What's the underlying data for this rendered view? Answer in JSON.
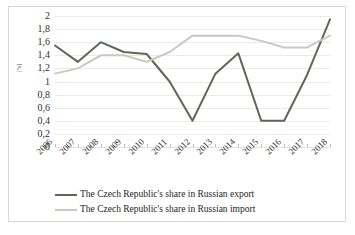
{
  "chart_data": {
    "type": "line",
    "title": "",
    "subtitle": "",
    "xlabel": "",
    "ylabel": "[%]",
    "categories": [
      "2006",
      "2007",
      "2008",
      "2009",
      "2010",
      "2011",
      "2012",
      "2013",
      "2014",
      "2015",
      "2016",
      "2017",
      "2018"
    ],
    "ylim": [
      0,
      2
    ],
    "ytick_labels": [
      "2",
      "1,8",
      "1,6",
      "1,4",
      "1,2",
      "1",
      "0,8",
      "0,6",
      "0,4",
      "0,2",
      "0"
    ],
    "ytick_values": [
      2,
      1.8,
      1.6,
      1.4,
      1.2,
      1,
      0.8,
      0.6,
      0.4,
      0.2,
      0
    ],
    "grid": true,
    "legend_position": "bottom",
    "series": [
      {
        "name": "The Czech Republic's share in Russian export",
        "color": "#5f665c",
        "values": [
          1.55,
          1.3,
          1.6,
          1.45,
          1.42,
          1.0,
          0.4,
          1.12,
          1.43,
          0.4,
          0.4,
          1.1,
          1.95
        ]
      },
      {
        "name": "The Czech Republic's share in Russian import",
        "color": "#c8cabf",
        "values": [
          1.12,
          1.2,
          1.4,
          1.4,
          1.3,
          1.45,
          1.7,
          1.7,
          1.7,
          1.62,
          1.52,
          1.52,
          1.7
        ]
      }
    ]
  },
  "legend": {
    "entries": [
      {
        "label": "The Czech Republic's share in Russian export",
        "color": "#5f665c"
      },
      {
        "label": "The Czech Republic's share in Russian import",
        "color": "#c8cabf"
      }
    ]
  },
  "axes": {
    "y_title": "[%]"
  }
}
